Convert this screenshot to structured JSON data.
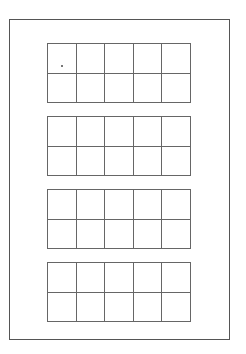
{
  "page": {
    "title": "",
    "border_color": "#555555",
    "line_color": "#666666"
  },
  "ten_frames": [
    {
      "rows": 2,
      "cols": 5,
      "top": 43
    },
    {
      "rows": 2,
      "cols": 5,
      "top": 116
    },
    {
      "rows": 2,
      "cols": 5,
      "top": 189
    },
    {
      "rows": 2,
      "cols": 5,
      "top": 262
    }
  ],
  "marks": [
    {
      "type": "dot",
      "frame": 0,
      "row": 0,
      "col": 0
    }
  ]
}
